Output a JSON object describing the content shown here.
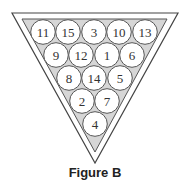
{
  "figure": {
    "caption": "Figure B",
    "colors": {
      "outline": "#444444",
      "fill": "#d6d6d6",
      "ball": "#ffffff",
      "text": "#333333"
    }
  },
  "rack": {
    "rows": [
      [
        "11",
        "15",
        "3",
        "10",
        "13"
      ],
      [
        "9",
        "12",
        "1",
        "6"
      ],
      [
        "8",
        "14",
        "5"
      ],
      [
        "2",
        "7"
      ],
      [
        "4"
      ]
    ],
    "balls": [
      {
        "label": "11",
        "cx": 43,
        "cy": 32
      },
      {
        "label": "15",
        "cx": 68,
        "cy": 32
      },
      {
        "label": "3",
        "cx": 94,
        "cy": 32
      },
      {
        "label": "10",
        "cx": 119,
        "cy": 32
      },
      {
        "label": "13",
        "cx": 145,
        "cy": 32
      },
      {
        "label": "9",
        "cx": 56,
        "cy": 55
      },
      {
        "label": "12",
        "cx": 81,
        "cy": 55
      },
      {
        "label": "1",
        "cx": 107,
        "cy": 55
      },
      {
        "label": "6",
        "cx": 132,
        "cy": 55
      },
      {
        "label": "8",
        "cx": 69,
        "cy": 78
      },
      {
        "label": "14",
        "cx": 94,
        "cy": 78
      },
      {
        "label": "5",
        "cx": 120,
        "cy": 78
      },
      {
        "label": "2",
        "cx": 82,
        "cy": 101
      },
      {
        "label": "7",
        "cx": 107,
        "cy": 101
      },
      {
        "label": "4",
        "cx": 95,
        "cy": 124
      }
    ]
  }
}
